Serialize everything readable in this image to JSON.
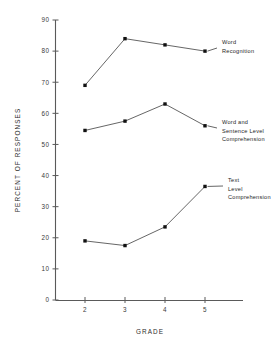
{
  "chart_data": {
    "type": "line",
    "title": "",
    "xlabel": "GRADE",
    "ylabel": "PERCENT OF RESPONSES",
    "categories": [
      2,
      3,
      4,
      5
    ],
    "x_tick_labels": [
      "2",
      "3",
      "4",
      "5"
    ],
    "y_tick_labels": [
      "0",
      "10",
      "20",
      "30",
      "40",
      "50",
      "60",
      "70",
      "80",
      "90"
    ],
    "y_ticks": [
      0,
      10,
      20,
      30,
      40,
      50,
      60,
      70,
      80,
      90
    ],
    "xlim": [
      1.5,
      5.5
    ],
    "ylim": [
      0,
      90
    ],
    "grid": false,
    "legend_position": "inline-right-annotations",
    "marker": "filled-square",
    "series": [
      {
        "name": "Word Recognition",
        "label_lines": [
          "Word",
          "Recognition"
        ],
        "values": [
          69,
          84,
          82,
          80
        ]
      },
      {
        "name": "Word and Sentence Level Comprehension",
        "label_lines": [
          "Word and",
          "Sentence Level",
          "Comprehension"
        ],
        "values": [
          54.5,
          57.5,
          63,
          56
        ]
      },
      {
        "name": "Text Level Comprehension",
        "label_lines": [
          "Text",
          "Level",
          "Comprehension"
        ],
        "values": [
          19,
          17.5,
          23.5,
          36.5
        ]
      }
    ]
  },
  "figure": {
    "background_color": "#ffffff",
    "line_color": "#4a4a4a",
    "marker_color": "#111111",
    "axis_color": "#5a5a5a",
    "text_color": "#1e1e1e"
  }
}
